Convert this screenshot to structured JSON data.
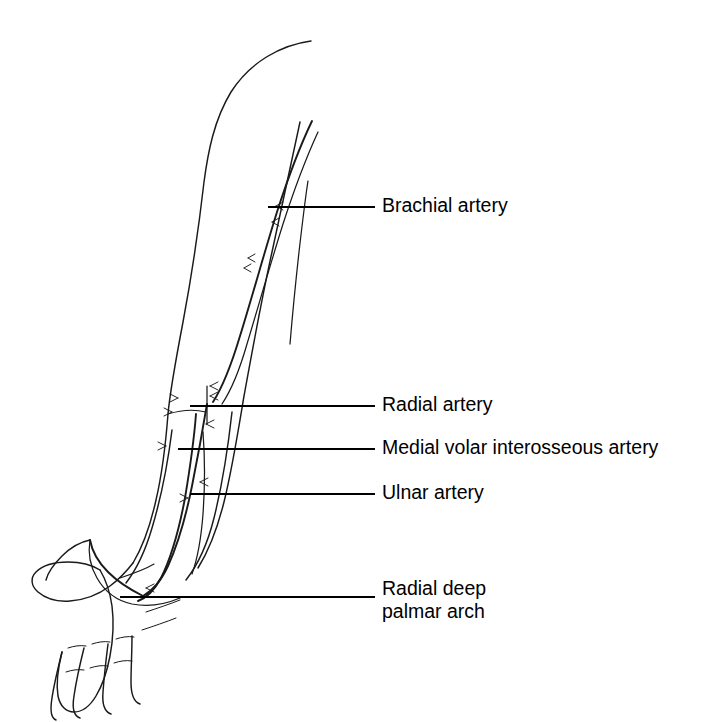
{
  "figure": {
    "background_color": "#ffffff",
    "ink_color": "#1a1a1a",
    "label_color": "#000000",
    "width": 724,
    "height": 722,
    "style": "pen-and-ink line drawing"
  },
  "labels": [
    {
      "id": "brachial-artery",
      "text": "Brachial artery",
      "text_x": 382,
      "text_y": 207,
      "leader_x1": 268,
      "leader_y1": 207,
      "leader_x2": 375,
      "leader_y2": 207
    },
    {
      "id": "radial-artery",
      "text": "Radial artery",
      "text_x": 382,
      "text_y": 406,
      "leader_x1": 190,
      "leader_y1": 406,
      "leader_x2": 375,
      "leader_y2": 406
    },
    {
      "id": "medial-volar-interosseous-artery",
      "text": "Medial volar interosseous artery",
      "text_x": 382,
      "text_y": 449,
      "leader_x1": 178,
      "leader_y1": 449,
      "leader_x2": 375,
      "leader_y2": 449
    },
    {
      "id": "ulnar-artery",
      "text": "Ulnar artery",
      "text_x": 382,
      "text_y": 494,
      "leader_x1": 190,
      "leader_y1": 494,
      "leader_x2": 375,
      "leader_y2": 494
    }
  ],
  "multiline_label": {
    "id": "radial-deep-palmar-arch",
    "line1": "Radial deep",
    "line2": "palmar arch",
    "text_x": 382,
    "line1_y": 590,
    "line2_y": 613,
    "leader_x1": 120,
    "leader_y1": 597,
    "leader_x2": 375,
    "leader_y2": 597
  },
  "anatomy": {
    "arm_outline_lateral": "M 311 41 C 281 45 250 62 231 92 C 214 120 208 152 204 182 C 199 226 192 274 183 322 C 175 364 170 392 168 414 C 166 440 163 470 156 500 C 150 527 142 548 133 563",
    "arm_outline_medial": "M 300 122 C 292 160 282 206 272 252 C 261 302 252 352 244 396 C 238 432 232 470 224 502 C 217 530 208 552 198 568",
    "forearm_outline_ulnar": "M 172 430 C 168 462 161 498 152 528 C 145 552 136 570 126 583",
    "forearm_outline_radial": "M 232 412 C 228 448 222 486 214 518 C 207 546 197 566 186 580",
    "elbow_crease": "M 168 414 C 181 410 194 409 206 412",
    "brachial_artery": "M 312 121 C 300 146 288 178 277 212 C 265 250 253 294 240 336 C 231 366 222 388 213 402",
    "brachial_artery_companion": "M 318 132 C 306 158 294 190 283 224 C 271 262 259 304 247 344 C 239 372 230 392 222 404",
    "brachial_short_vein": "M 308 181 C 305 200 302 226 299 252 C 295 288 292 320 290 344",
    "radial_artery": "M 207 404 C 203 428 198 456 192 486 C 186 516 178 544 168 566 C 161 581 152 591 143 596",
    "ulnar_artery": "M 196 414 C 194 440 190 468 185 498 C 179 530 171 558 161 578 C 154 591 146 598 138 601",
    "interosseous_artery": "M 203 432 C 205 458 205 486 203 514 C 201 540 197 560 192 574",
    "deep_palmar_arch": "M 143 596 C 131 590 118 582 108 572 C 98 562 92 551 90 540",
    "palmar_arch_curve": "M 90 540 C 88 552 90 566 97 578 C 105 592 118 601 132 604 C 148 607 166 604 180 598",
    "hand_outline": "M 133 563 C 126 572 118 580 110 586 C 98 595 84 600 70 601 C 56 602 45 598 38 592 C 31 586 30 578 36 572 C 43 565 55 562 68 562 C 80 562 92 565 100 570",
    "palm_outline": "M 100 570 C 106 580 110 592 112 606 C 114 622 113 640 110 656 C 107 672 102 686 96 696 C 90 706 82 712 74 712 C 66 712 60 706 58 696 C 56 684 58 668 62 652",
    "fingers": [
      "M 62 652 C 58 668 54 684 52 698 C 50 710 51 718 56 720",
      "M 84 648 C 80 664 76 682 74 696 C 72 708 74 716 80 718",
      "M 108 644 C 106 660 104 678 103 692 C 102 704 105 712 111 714",
      "M 132 636 C 132 652 131 668 131 682 C 131 694 134 702 140 704"
    ],
    "knuckle_creases": [
      "M 68 648 C 74 646 80 645 86 646",
      "M 92 644 C 98 642 104 641 110 642",
      "M 116 639 C 122 637 128 636 134 637",
      "M 66 672 C 72 670 78 669 84 670",
      "M 90 668 C 96 666 102 665 108 666",
      "M 114 663 C 120 661 126 660 132 661",
      "M 146 612 C 158 608 170 604 180 600",
      "M 142 630 C 154 626 166 622 176 618"
    ],
    "thumb": "M 90 540 C 80 542 70 548 62 556 C 54 564 48 572 46 580",
    "wrist_crease": "M 120 578 C 132 574 144 570 154 564",
    "branch_ticks": [
      "M 276 206 L 283 202 M 276 206 L 283 210",
      "M 272 222 L 279 218 M 272 222 L 279 226",
      "M 248 258 L 255 254 M 248 258 L 255 262",
      "M 244 268 L 251 264 M 244 268 L 251 272",
      "M 210 386 L 218 382 M 210 386 L 218 390",
      "M 210 396 L 218 392 M 210 396 L 218 400",
      "M 206 424 L 214 420 M 206 424 L 214 428",
      "M 200 482 L 208 478 M 200 482 L 208 486",
      "M 178 398 L 170 394 M 178 398 L 170 402",
      "M 172 412 L 164 408 M 172 412 L 164 416",
      "M 166 446 L 158 442 M 166 446 L 158 450",
      "M 188 498 L 180 494 M 188 498 L 180 502",
      "M 146 588 L 154 584 M 146 588 L 154 592"
    ],
    "elbow_bracket": "M 207 386 L 207 424"
  }
}
